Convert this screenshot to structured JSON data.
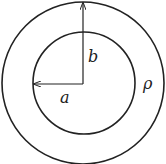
{
  "diagram": {
    "labels": {
      "inner_radius": "a",
      "outer_radius": "b",
      "region": "ρ"
    },
    "colors": {
      "stroke": "#222222",
      "background": "#ffffff"
    }
  }
}
